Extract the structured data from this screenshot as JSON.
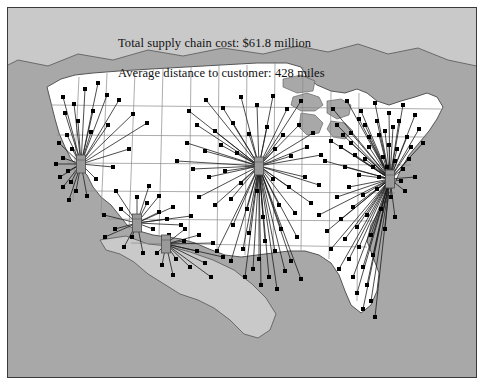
{
  "figure": {
    "title": "",
    "background_color": "#a8a8a8",
    "border_color": "#3a3a3a",
    "land_color": "#ffffff",
    "water_color": "#a8a8a8",
    "foreign_land_color": "#c9c9c9",
    "state_border_color": "#8a8a8a",
    "country_border_color": "#555555",
    "route_color": "#1a1a1a",
    "customer_color": "#000000",
    "hub_color": "#9a9a9a",
    "hub_edge_color": "#4a4a4a"
  },
  "annotations": [
    {
      "id": "total-cost",
      "text": "Total supply chain cost: $61.8 million"
    },
    {
      "id": "avg-distance",
      "text": "Average distance to customer: 428 miles"
    }
  ],
  "chart_data": {
    "type": "map",
    "title": "",
    "subtitle": "",
    "xlabel": "",
    "ylabel": "",
    "legend_position": "none",
    "grid": false,
    "region": "United States (contiguous) with Canada and Mexico",
    "projection": "albers-equal-area",
    "metrics": {
      "total_supply_chain_cost": "$61.8 million",
      "total_supply_chain_cost_value": 61.8,
      "total_supply_chain_cost_units": "million USD",
      "average_distance_to_customer": "428 miles",
      "average_distance_to_customer_value": 428,
      "average_distance_to_customer_units": "miles"
    },
    "hubs": [
      {
        "name": "west-coast-hub",
        "x": 80,
        "y": 163,
        "customers_served": 28
      },
      {
        "name": "southwest-hub",
        "x": 136,
        "y": 222,
        "customers_served": 17
      },
      {
        "name": "south-central-hub",
        "x": 165,
        "y": 243,
        "customers_served": 14
      },
      {
        "name": "midwest-hub",
        "x": 258,
        "y": 165,
        "customers_served": 62
      },
      {
        "name": "northeast-hub",
        "x": 389,
        "y": 178,
        "customers_served": 71
      }
    ],
    "customers": [
      {
        "x": 97,
        "y": 82,
        "hub": 0
      },
      {
        "x": 84,
        "y": 88,
        "hub": 0
      },
      {
        "x": 106,
        "y": 94,
        "hub": 0
      },
      {
        "x": 62,
        "y": 96,
        "hub": 0
      },
      {
        "x": 73,
        "y": 103,
        "hub": 0
      },
      {
        "x": 118,
        "y": 99,
        "hub": 0
      },
      {
        "x": 92,
        "y": 110,
        "hub": 0
      },
      {
        "x": 64,
        "y": 112,
        "hub": 0
      },
      {
        "x": 77,
        "y": 120,
        "hub": 0
      },
      {
        "x": 107,
        "y": 124,
        "hub": 0
      },
      {
        "x": 132,
        "y": 113,
        "hub": 0
      },
      {
        "x": 146,
        "y": 122,
        "hub": 0
      },
      {
        "x": 90,
        "y": 131,
        "hub": 0
      },
      {
        "x": 66,
        "y": 134,
        "hub": 0
      },
      {
        "x": 58,
        "y": 142,
        "hub": 0
      },
      {
        "x": 71,
        "y": 148,
        "hub": 0
      },
      {
        "x": 62,
        "y": 157,
        "hub": 0
      },
      {
        "x": 55,
        "y": 163,
        "hub": 0
      },
      {
        "x": 67,
        "y": 170,
        "hub": 0
      },
      {
        "x": 59,
        "y": 176,
        "hub": 0
      },
      {
        "x": 70,
        "y": 181,
        "hub": 0
      },
      {
        "x": 62,
        "y": 186,
        "hub": 0
      },
      {
        "x": 75,
        "y": 190,
        "hub": 0
      },
      {
        "x": 86,
        "y": 195,
        "hub": 0
      },
      {
        "x": 68,
        "y": 199,
        "hub": 0
      },
      {
        "x": 95,
        "y": 178,
        "hub": 0
      },
      {
        "x": 112,
        "y": 166,
        "hub": 0
      },
      {
        "x": 128,
        "y": 148,
        "hub": 0
      },
      {
        "x": 120,
        "y": 208,
        "hub": 1
      },
      {
        "x": 103,
        "y": 214,
        "hub": 1
      },
      {
        "x": 146,
        "y": 202,
        "hub": 1
      },
      {
        "x": 158,
        "y": 195,
        "hub": 1
      },
      {
        "x": 172,
        "y": 206,
        "hub": 1
      },
      {
        "x": 131,
        "y": 236,
        "hub": 1
      },
      {
        "x": 114,
        "y": 228,
        "hub": 1
      },
      {
        "x": 152,
        "y": 228,
        "hub": 1
      },
      {
        "x": 166,
        "y": 218,
        "hub": 1
      },
      {
        "x": 180,
        "y": 224,
        "hub": 1
      },
      {
        "x": 123,
        "y": 246,
        "hub": 1
      },
      {
        "x": 142,
        "y": 252,
        "hub": 1
      },
      {
        "x": 104,
        "y": 236,
        "hub": 1
      },
      {
        "x": 158,
        "y": 211,
        "hub": 1
      },
      {
        "x": 190,
        "y": 215,
        "hub": 1
      },
      {
        "x": 136,
        "y": 196,
        "hub": 1
      },
      {
        "x": 115,
        "y": 190,
        "hub": 1
      },
      {
        "x": 148,
        "y": 185,
        "hub": 1
      },
      {
        "x": 183,
        "y": 240,
        "hub": 2
      },
      {
        "x": 196,
        "y": 250,
        "hub": 2
      },
      {
        "x": 175,
        "y": 258,
        "hub": 2
      },
      {
        "x": 189,
        "y": 266,
        "hub": 2
      },
      {
        "x": 204,
        "y": 262,
        "hub": 2
      },
      {
        "x": 161,
        "y": 264,
        "hub": 2
      },
      {
        "x": 172,
        "y": 274,
        "hub": 2
      },
      {
        "x": 210,
        "y": 276,
        "hub": 2
      },
      {
        "x": 198,
        "y": 234,
        "hub": 2
      },
      {
        "x": 212,
        "y": 242,
        "hub": 2
      },
      {
        "x": 156,
        "y": 252,
        "hub": 2
      },
      {
        "x": 222,
        "y": 256,
        "hub": 2
      },
      {
        "x": 184,
        "y": 228,
        "hub": 2
      },
      {
        "x": 168,
        "y": 234,
        "hub": 2
      },
      {
        "x": 188,
        "y": 110,
        "hub": 3
      },
      {
        "x": 205,
        "y": 99,
        "hub": 3
      },
      {
        "x": 222,
        "y": 107,
        "hub": 3
      },
      {
        "x": 240,
        "y": 96,
        "hub": 3
      },
      {
        "x": 256,
        "y": 104,
        "hub": 3
      },
      {
        "x": 272,
        "y": 95,
        "hub": 3
      },
      {
        "x": 286,
        "y": 108,
        "hub": 3
      },
      {
        "x": 300,
        "y": 100,
        "hub": 3
      },
      {
        "x": 196,
        "y": 124,
        "hub": 3
      },
      {
        "x": 214,
        "y": 130,
        "hub": 3
      },
      {
        "x": 232,
        "y": 122,
        "hub": 3
      },
      {
        "x": 248,
        "y": 133,
        "hub": 3
      },
      {
        "x": 266,
        "y": 126,
        "hub": 3
      },
      {
        "x": 282,
        "y": 134,
        "hub": 3
      },
      {
        "x": 298,
        "y": 124,
        "hub": 3
      },
      {
        "x": 312,
        "y": 132,
        "hub": 3
      },
      {
        "x": 186,
        "y": 142,
        "hub": 3
      },
      {
        "x": 204,
        "y": 150,
        "hub": 3
      },
      {
        "x": 220,
        "y": 144,
        "hub": 3
      },
      {
        "x": 236,
        "y": 152,
        "hub": 3
      },
      {
        "x": 274,
        "y": 148,
        "hub": 3
      },
      {
        "x": 290,
        "y": 155,
        "hub": 3
      },
      {
        "x": 306,
        "y": 146,
        "hub": 3
      },
      {
        "x": 320,
        "y": 154,
        "hub": 3
      },
      {
        "x": 176,
        "y": 160,
        "hub": 3
      },
      {
        "x": 192,
        "y": 168,
        "hub": 3
      },
      {
        "x": 208,
        "y": 176,
        "hub": 3
      },
      {
        "x": 224,
        "y": 170,
        "hub": 3
      },
      {
        "x": 240,
        "y": 182,
        "hub": 3
      },
      {
        "x": 256,
        "y": 190,
        "hub": 3
      },
      {
        "x": 272,
        "y": 178,
        "hub": 3
      },
      {
        "x": 288,
        "y": 186,
        "hub": 3
      },
      {
        "x": 304,
        "y": 176,
        "hub": 3
      },
      {
        "x": 318,
        "y": 184,
        "hub": 3
      },
      {
        "x": 198,
        "y": 196,
        "hub": 3
      },
      {
        "x": 214,
        "y": 204,
        "hub": 3
      },
      {
        "x": 230,
        "y": 198,
        "hub": 3
      },
      {
        "x": 246,
        "y": 208,
        "hub": 3
      },
      {
        "x": 262,
        "y": 216,
        "hub": 3
      },
      {
        "x": 278,
        "y": 204,
        "hub": 3
      },
      {
        "x": 294,
        "y": 212,
        "hub": 3
      },
      {
        "x": 310,
        "y": 202,
        "hub": 3
      },
      {
        "x": 232,
        "y": 224,
        "hub": 3
      },
      {
        "x": 248,
        "y": 232,
        "hub": 3
      },
      {
        "x": 264,
        "y": 240,
        "hub": 3
      },
      {
        "x": 280,
        "y": 228,
        "hub": 3
      },
      {
        "x": 296,
        "y": 236,
        "hub": 3
      },
      {
        "x": 242,
        "y": 248,
        "hub": 3
      },
      {
        "x": 258,
        "y": 258,
        "hub": 3
      },
      {
        "x": 274,
        "y": 250,
        "hub": 3
      },
      {
        "x": 290,
        "y": 260,
        "hub": 3
      },
      {
        "x": 252,
        "y": 268,
        "hub": 3
      },
      {
        "x": 268,
        "y": 276,
        "hub": 3
      },
      {
        "x": 284,
        "y": 270,
        "hub": 3
      },
      {
        "x": 300,
        "y": 278,
        "hub": 3
      },
      {
        "x": 230,
        "y": 260,
        "hub": 3
      },
      {
        "x": 216,
        "y": 250,
        "hub": 3
      },
      {
        "x": 244,
        "y": 276,
        "hub": 3
      },
      {
        "x": 260,
        "y": 284,
        "hub": 3
      },
      {
        "x": 276,
        "y": 288,
        "hub": 3
      },
      {
        "x": 332,
        "y": 108,
        "hub": 4
      },
      {
        "x": 346,
        "y": 100,
        "hub": 4
      },
      {
        "x": 360,
        "y": 110,
        "hub": 4
      },
      {
        "x": 374,
        "y": 102,
        "hub": 4
      },
      {
        "x": 388,
        "y": 112,
        "hub": 4
      },
      {
        "x": 402,
        "y": 104,
        "hub": 4
      },
      {
        "x": 414,
        "y": 114,
        "hub": 4
      },
      {
        "x": 336,
        "y": 124,
        "hub": 4
      },
      {
        "x": 350,
        "y": 132,
        "hub": 4
      },
      {
        "x": 364,
        "y": 124,
        "hub": 4
      },
      {
        "x": 378,
        "y": 134,
        "hub": 4
      },
      {
        "x": 392,
        "y": 126,
        "hub": 4
      },
      {
        "x": 406,
        "y": 136,
        "hub": 4
      },
      {
        "x": 418,
        "y": 128,
        "hub": 4
      },
      {
        "x": 340,
        "y": 146,
        "hub": 4
      },
      {
        "x": 354,
        "y": 154,
        "hub": 4
      },
      {
        "x": 368,
        "y": 146,
        "hub": 4
      },
      {
        "x": 382,
        "y": 156,
        "hub": 4
      },
      {
        "x": 396,
        "y": 148,
        "hub": 4
      },
      {
        "x": 408,
        "y": 158,
        "hub": 4
      },
      {
        "x": 344,
        "y": 166,
        "hub": 4
      },
      {
        "x": 358,
        "y": 174,
        "hub": 4
      },
      {
        "x": 372,
        "y": 166,
        "hub": 4
      },
      {
        "x": 402,
        "y": 168,
        "hub": 4
      },
      {
        "x": 414,
        "y": 176,
        "hub": 4
      },
      {
        "x": 348,
        "y": 186,
        "hub": 4
      },
      {
        "x": 362,
        "y": 194,
        "hub": 4
      },
      {
        "x": 376,
        "y": 188,
        "hub": 4
      },
      {
        "x": 390,
        "y": 196,
        "hub": 4
      },
      {
        "x": 404,
        "y": 190,
        "hub": 4
      },
      {
        "x": 336,
        "y": 196,
        "hub": 4
      },
      {
        "x": 352,
        "y": 206,
        "hub": 4
      },
      {
        "x": 366,
        "y": 214,
        "hub": 4
      },
      {
        "x": 380,
        "y": 208,
        "hub": 4
      },
      {
        "x": 394,
        "y": 216,
        "hub": 4
      },
      {
        "x": 340,
        "y": 218,
        "hub": 4
      },
      {
        "x": 356,
        "y": 226,
        "hub": 4
      },
      {
        "x": 370,
        "y": 234,
        "hub": 4
      },
      {
        "x": 384,
        "y": 228,
        "hub": 4
      },
      {
        "x": 344,
        "y": 238,
        "hub": 4
      },
      {
        "x": 358,
        "y": 246,
        "hub": 4
      },
      {
        "x": 372,
        "y": 254,
        "hub": 4
      },
      {
        "x": 330,
        "y": 248,
        "hub": 4
      },
      {
        "x": 348,
        "y": 258,
        "hub": 4
      },
      {
        "x": 362,
        "y": 266,
        "hub": 4
      },
      {
        "x": 338,
        "y": 268,
        "hub": 4
      },
      {
        "x": 352,
        "y": 276,
        "hub": 4
      },
      {
        "x": 366,
        "y": 284,
        "hub": 4
      },
      {
        "x": 356,
        "y": 292,
        "hub": 4
      },
      {
        "x": 370,
        "y": 300,
        "hub": 4
      },
      {
        "x": 362,
        "y": 308,
        "hub": 4
      },
      {
        "x": 374,
        "y": 316,
        "hub": 4
      },
      {
        "x": 326,
        "y": 230,
        "hub": 4
      },
      {
        "x": 318,
        "y": 214,
        "hub": 4
      },
      {
        "x": 388,
        "y": 144,
        "hub": 4
      },
      {
        "x": 398,
        "y": 120,
        "hub": 4
      },
      {
        "x": 410,
        "y": 146,
        "hub": 4
      },
      {
        "x": 422,
        "y": 142,
        "hub": 4
      },
      {
        "x": 384,
        "y": 130,
        "hub": 4
      },
      {
        "x": 394,
        "y": 160,
        "hub": 4
      },
      {
        "x": 376,
        "y": 120,
        "hub": 4
      },
      {
        "x": 368,
        "y": 136,
        "hub": 4
      },
      {
        "x": 358,
        "y": 118,
        "hub": 4
      },
      {
        "x": 400,
        "y": 180,
        "hub": 4
      },
      {
        "x": 386,
        "y": 166,
        "hub": 4
      },
      {
        "x": 378,
        "y": 176,
        "hub": 4
      },
      {
        "x": 364,
        "y": 158,
        "hub": 4
      },
      {
        "x": 350,
        "y": 142,
        "hub": 4
      },
      {
        "x": 342,
        "y": 134,
        "hub": 4
      },
      {
        "x": 330,
        "y": 140,
        "hub": 4
      },
      {
        "x": 324,
        "y": 160,
        "hub": 4
      }
    ]
  }
}
